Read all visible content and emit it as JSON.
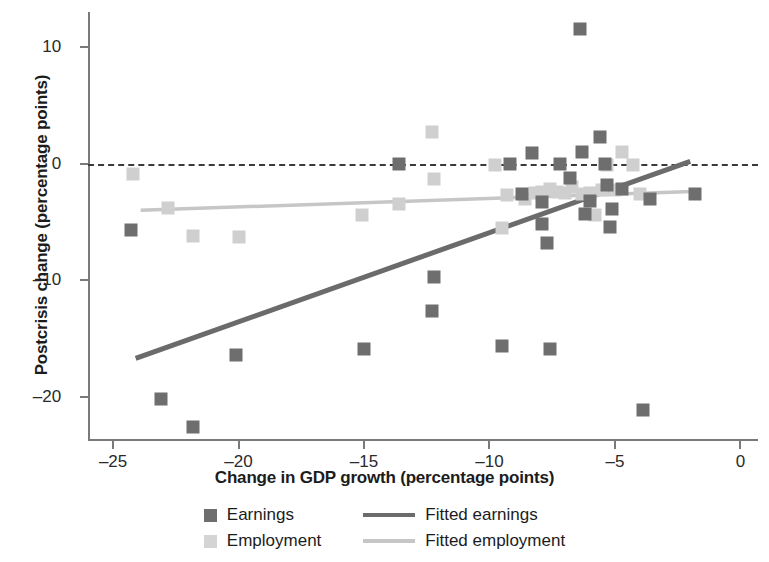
{
  "chart_data": {
    "type": "scatter",
    "title": "",
    "xlabel": "Change in GDP growth (percentage points)",
    "ylabel": "Postcrisis change (percentage points)",
    "xlim": [
      -26.0,
      0.7
    ],
    "ylim": [
      -23.7,
      13.0
    ],
    "xticks": [
      -25,
      -20,
      -15,
      -10,
      -5,
      0
    ],
    "xtick_labels": [
      "–25",
      "–20",
      "–15",
      "–10",
      "–5",
      "0"
    ],
    "yticks": [
      10,
      0,
      -10,
      -20
    ],
    "ytick_labels": [
      "10",
      "0",
      "–10",
      "–20"
    ],
    "grid": false,
    "legend_position": "bottom",
    "reference_lines": [
      {
        "name": "zero-line",
        "axis": "y",
        "value": 0,
        "style": "dashed",
        "color": "#3a3a3a"
      }
    ],
    "series": [
      {
        "name": "Earnings",
        "marker": "square",
        "color": "#6e6e6e",
        "points": [
          [
            -24.3,
            -5.7
          ],
          [
            -23.1,
            -20.2
          ],
          [
            -21.8,
            -22.6
          ],
          [
            -20.1,
            -16.4
          ],
          [
            -15.0,
            -15.9
          ],
          [
            -13.6,
            0.0
          ],
          [
            -12.3,
            -12.6
          ],
          [
            -12.2,
            -9.7
          ],
          [
            -9.5,
            -15.6
          ],
          [
            -9.2,
            0.0
          ],
          [
            -8.7,
            -2.6
          ],
          [
            -8.3,
            0.9
          ],
          [
            -7.9,
            -5.2
          ],
          [
            -7.9,
            -3.3
          ],
          [
            -7.7,
            -6.8
          ],
          [
            -7.6,
            -15.9
          ],
          [
            -7.2,
            0.0
          ],
          [
            -6.8,
            -1.2
          ],
          [
            -6.4,
            11.5
          ],
          [
            -6.3,
            1.0
          ],
          [
            -6.2,
            -4.3
          ],
          [
            -6.0,
            -3.2
          ],
          [
            -5.6,
            2.3
          ],
          [
            -5.4,
            0.0
          ],
          [
            -5.3,
            -1.8
          ],
          [
            -5.2,
            -5.4
          ],
          [
            -5.1,
            -3.9
          ],
          [
            -4.7,
            -2.2
          ],
          [
            -3.9,
            -21.1
          ],
          [
            -3.6,
            -3.0
          ],
          [
            -1.8,
            -2.6
          ]
        ]
      },
      {
        "name": "Employment",
        "marker": "square",
        "color": "#cfcfcf",
        "points": [
          [
            -24.2,
            -0.9
          ],
          [
            -22.8,
            -3.8
          ],
          [
            -21.8,
            -6.2
          ],
          [
            -20.0,
            -6.3
          ],
          [
            -15.1,
            -4.4
          ],
          [
            -13.6,
            -3.5
          ],
          [
            -12.3,
            2.7
          ],
          [
            -12.2,
            -1.3
          ],
          [
            -9.8,
            -0.1
          ],
          [
            -9.5,
            -5.5
          ],
          [
            -9.3,
            -2.7
          ],
          [
            -8.6,
            -3.0
          ],
          [
            -8.2,
            -2.5
          ],
          [
            -7.9,
            -2.4
          ],
          [
            -7.6,
            -2.2
          ],
          [
            -7.3,
            -2.4
          ],
          [
            -7.0,
            -2.5
          ],
          [
            -6.7,
            -2.0
          ],
          [
            -6.3,
            -2.6
          ],
          [
            -6.0,
            -2.5
          ],
          [
            -5.8,
            -4.4
          ],
          [
            -5.5,
            -2.3
          ],
          [
            -5.3,
            -0.1
          ],
          [
            -5.0,
            -2.3
          ],
          [
            -4.7,
            1.0
          ],
          [
            -4.3,
            -0.1
          ],
          [
            -4.0,
            -2.6
          ]
        ]
      }
    ],
    "fits": [
      {
        "name": "Fitted earnings",
        "color": "#6b6b6b",
        "x0": -24.1,
        "y0": -16.7,
        "x1": -2.0,
        "y1": 0.2
      },
      {
        "name": "Fitted employment",
        "color": "#c6c6c6",
        "x0": -23.9,
        "y0": -4.0,
        "x1": -1.9,
        "y1": -2.4
      }
    ],
    "legend": [
      {
        "label": "Earnings",
        "kind": "marker",
        "series": "earnings"
      },
      {
        "label": "Fitted earnings",
        "kind": "line",
        "series": "earnings"
      },
      {
        "label": "Employment",
        "kind": "marker",
        "series": "employment"
      },
      {
        "label": "Fitted employment",
        "kind": "line",
        "series": "employment"
      }
    ]
  }
}
